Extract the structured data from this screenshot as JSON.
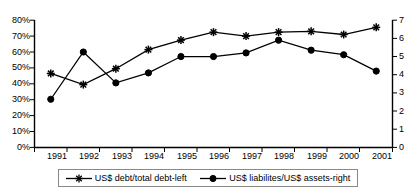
{
  "chart_data": {
    "type": "line",
    "title": "",
    "subtitle": "",
    "xlabel": "",
    "ylabel": "",
    "grid": false,
    "legend_position": "bottom",
    "categories": [
      "1991",
      "1992",
      "1993",
      "1994",
      "1995",
      "1996",
      "1997",
      "1998",
      "1999",
      "2000",
      "2001"
    ],
    "axes": {
      "left": {
        "label": "",
        "ylim": [
          0,
          80
        ],
        "ticks": [
          0,
          10,
          20,
          30,
          40,
          50,
          60,
          70,
          80
        ],
        "tick_labels": [
          "0%",
          "10%",
          "20%",
          "30%",
          "40%",
          "50%",
          "60%",
          "70%",
          "80%"
        ],
        "unit": "%"
      },
      "right": {
        "label": "",
        "ylim": [
          0,
          7
        ],
        "ticks": [
          0,
          1,
          2,
          3,
          4,
          5,
          6,
          7
        ],
        "tick_labels": [
          "0",
          "1",
          "2",
          "3",
          "4",
          "5",
          "6",
          "7"
        ],
        "unit": ""
      }
    },
    "series": [
      {
        "name": "US$ debt/total debt-left",
        "axis": "left",
        "marker": "star",
        "color": "#000000",
        "values": [
          46.5,
          39.5,
          49.5,
          61.5,
          67.5,
          72.5,
          70.0,
          72.5,
          73.0,
          71.0,
          75.5
        ]
      },
      {
        "name": "US$ liabilites/US$ assets-right",
        "axis": "right",
        "marker": "circle",
        "color": "#000000",
        "values": [
          2.65,
          5.25,
          3.55,
          4.1,
          5.0,
          5.0,
          5.2,
          5.9,
          5.35,
          5.1,
          4.2
        ]
      }
    ]
  },
  "legend": {
    "entries": [
      {
        "label": "US$ debt/total debt-left",
        "marker": "star-marker-icon"
      },
      {
        "label": "US$ liabilites/US$ assets-right",
        "marker": "circle-marker-icon"
      }
    ]
  }
}
